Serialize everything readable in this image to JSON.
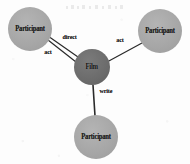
{
  "diagram": {
    "background_color": "#fdfdfd",
    "center_node_color": "#6b6b6b",
    "outer_node_color": "#a8a8a8",
    "edge_color": "#2a2a2a",
    "nodes": [
      {
        "id": "participant-top-left",
        "label": "Participant",
        "cx": 30,
        "cy": 29,
        "r": 22,
        "kind": "outer"
      },
      {
        "id": "participant-top-right",
        "label": "Participant",
        "cx": 160,
        "cy": 31,
        "r": 22,
        "kind": "outer"
      },
      {
        "id": "film",
        "label": "Film",
        "cx": 92,
        "cy": 67,
        "r": 18,
        "kind": "center"
      },
      {
        "id": "participant-bottom",
        "label": "Participant",
        "cx": 96,
        "cy": 137,
        "r": 22,
        "kind": "outer"
      }
    ],
    "edges": [
      {
        "id": "edge-direct",
        "label": "direct",
        "from": "participant-top-left",
        "to": "film",
        "x1": 48,
        "y1": 36,
        "x2": 78,
        "y2": 57,
        "label_x": 62,
        "label_y": 33
      },
      {
        "id": "edge-act-left",
        "label": "act",
        "from": "participant-top-left",
        "to": "film",
        "x1": 48,
        "y1": 40,
        "x2": 76,
        "y2": 62,
        "label_x": 44,
        "label_y": 48
      },
      {
        "id": "edge-act-right",
        "label": "act",
        "from": "participant-top-right",
        "to": "film",
        "x1": 142,
        "y1": 43,
        "x2": 107,
        "y2": 62,
        "label_x": 116,
        "label_y": 36
      },
      {
        "id": "edge-write",
        "label": "write",
        "from": "film",
        "to": "participant-bottom",
        "x1": 93,
        "y1": 85,
        "x2": 95,
        "y2": 116,
        "label_x": 99,
        "label_y": 87
      }
    ],
    "artifact": {
      "id": "scan-smudge",
      "description": "faint illegible scan artifact"
    }
  }
}
